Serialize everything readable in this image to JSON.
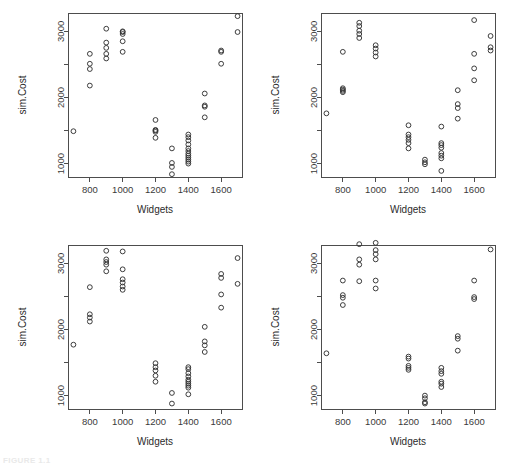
{
  "figure": {
    "caption_fragment": "FIGURE 1.1",
    "panel_count": 4,
    "layout": "2x2 grid of scatterplots"
  },
  "axes": {
    "xlabel": "Widgets",
    "ylabel": "sim.Cost",
    "x_ticks": [
      800,
      1000,
      1200,
      1400,
      1600
    ],
    "x_tick_labels": [
      "800",
      "1000",
      "1200",
      "1400",
      "1600"
    ],
    "y_ticks": [
      1000,
      2000,
      3000
    ],
    "y_tick_labels": [
      "1000",
      "2000",
      "3000"
    ],
    "y_minor_ticks": [
      1500,
      2500
    ],
    "xlim": [
      670,
      1730
    ],
    "ylim": [
      790,
      3270
    ],
    "grid": false,
    "marker": "open-circle"
  },
  "chart_data": [
    {
      "type": "scatter",
      "title": "",
      "panel": "top-left",
      "xlabel": "Widgets",
      "ylabel": "sim.Cost",
      "xlim": [
        670,
        1730
      ],
      "ylim": [
        790,
        3270
      ],
      "x_ticks": [
        800,
        1000,
        1200,
        1400,
        1600
      ],
      "y_ticks": [
        1000,
        2000,
        3000
      ],
      "grid": false,
      "legend": null,
      "series": [
        {
          "name": "sim.Cost",
          "points": [
            [
              700,
              1490
            ],
            [
              800,
              2180
            ],
            [
              800,
              2430
            ],
            [
              800,
              2510
            ],
            [
              800,
              2660
            ],
            [
              900,
              2590
            ],
            [
              900,
              2660
            ],
            [
              900,
              2750
            ],
            [
              900,
              2830
            ],
            [
              900,
              3040
            ],
            [
              1000,
              2690
            ],
            [
              1000,
              2850
            ],
            [
              1000,
              2960
            ],
            [
              1000,
              2990
            ],
            [
              1000,
              3000
            ],
            [
              1200,
              1390
            ],
            [
              1200,
              1480
            ],
            [
              1200,
              1500
            ],
            [
              1200,
              1510
            ],
            [
              1200,
              1660
            ],
            [
              1300,
              840
            ],
            [
              1300,
              950
            ],
            [
              1300,
              1010
            ],
            [
              1300,
              1230
            ],
            [
              1400,
              1000
            ],
            [
              1400,
              1030
            ],
            [
              1400,
              1060
            ],
            [
              1400,
              1090
            ],
            [
              1400,
              1120
            ],
            [
              1400,
              1150
            ],
            [
              1400,
              1190
            ],
            [
              1400,
              1230
            ],
            [
              1400,
              1290
            ],
            [
              1400,
              1350
            ],
            [
              1400,
              1400
            ],
            [
              1400,
              1440
            ],
            [
              1500,
              1700
            ],
            [
              1500,
              1860
            ],
            [
              1500,
              1880
            ],
            [
              1500,
              2060
            ],
            [
              1600,
              2510
            ],
            [
              1600,
              2690
            ],
            [
              1600,
              2710
            ],
            [
              1700,
              2990
            ],
            [
              1700,
              3230
            ]
          ]
        }
      ]
    },
    {
      "type": "scatter",
      "title": "",
      "panel": "top-right",
      "xlabel": "Widgets",
      "ylabel": "sim.Cost",
      "xlim": [
        670,
        1730
      ],
      "ylim": [
        790,
        3270
      ],
      "x_ticks": [
        800,
        1000,
        1200,
        1400,
        1600
      ],
      "y_ticks": [
        1000,
        2000,
        3000
      ],
      "grid": false,
      "legend": null,
      "series": [
        {
          "name": "sim.Cost",
          "points": [
            [
              700,
              1760
            ],
            [
              800,
              2080
            ],
            [
              800,
              2100
            ],
            [
              800,
              2120
            ],
            [
              800,
              2140
            ],
            [
              800,
              2690
            ],
            [
              900,
              2900
            ],
            [
              900,
              2960
            ],
            [
              900,
              3010
            ],
            [
              900,
              3080
            ],
            [
              900,
              3130
            ],
            [
              1000,
              2620
            ],
            [
              1000,
              2680
            ],
            [
              1000,
              2740
            ],
            [
              1000,
              2790
            ],
            [
              1200,
              1230
            ],
            [
              1200,
              1310
            ],
            [
              1200,
              1360
            ],
            [
              1200,
              1400
            ],
            [
              1200,
              1440
            ],
            [
              1200,
              1580
            ],
            [
              1300,
              990
            ],
            [
              1300,
              1020
            ],
            [
              1300,
              1060
            ],
            [
              1400,
              890
            ],
            [
              1400,
              1080
            ],
            [
              1400,
              1120
            ],
            [
              1400,
              1160
            ],
            [
              1400,
              1240
            ],
            [
              1400,
              1280
            ],
            [
              1400,
              1310
            ],
            [
              1400,
              1560
            ],
            [
              1500,
              1680
            ],
            [
              1500,
              1840
            ],
            [
              1500,
              1900
            ],
            [
              1500,
              2110
            ],
            [
              1600,
              2260
            ],
            [
              1600,
              2440
            ],
            [
              1600,
              2660
            ],
            [
              1600,
              3170
            ],
            [
              1700,
              2710
            ],
            [
              1700,
              2760
            ],
            [
              1700,
              2930
            ]
          ]
        }
      ]
    },
    {
      "type": "scatter",
      "title": "",
      "panel": "bottom-left",
      "xlabel": "Widgets",
      "ylabel": "sim.Cost",
      "xlim": [
        670,
        1730
      ],
      "ylim": [
        790,
        3270
      ],
      "x_ticks": [
        800,
        1000,
        1200,
        1400,
        1600
      ],
      "y_ticks": [
        1000,
        2000,
        3000
      ],
      "grid": false,
      "legend": null,
      "series": [
        {
          "name": "sim.Cost",
          "points": [
            [
              700,
              1770
            ],
            [
              800,
              2120
            ],
            [
              800,
              2180
            ],
            [
              800,
              2230
            ],
            [
              800,
              2640
            ],
            [
              900,
              2880
            ],
            [
              900,
              2980
            ],
            [
              900,
              3020
            ],
            [
              900,
              3060
            ],
            [
              900,
              3190
            ],
            [
              1000,
              2600
            ],
            [
              1000,
              2650
            ],
            [
              1000,
              2710
            ],
            [
              1000,
              2760
            ],
            [
              1000,
              2910
            ],
            [
              1000,
              3180
            ],
            [
              1200,
              1210
            ],
            [
              1200,
              1300
            ],
            [
              1200,
              1380
            ],
            [
              1200,
              1430
            ],
            [
              1200,
              1490
            ],
            [
              1300,
              880
            ],
            [
              1300,
              1040
            ],
            [
              1400,
              1020
            ],
            [
              1400,
              1120
            ],
            [
              1400,
              1150
            ],
            [
              1400,
              1180
            ],
            [
              1400,
              1210
            ],
            [
              1400,
              1240
            ],
            [
              1400,
              1290
            ],
            [
              1400,
              1340
            ],
            [
              1400,
              1400
            ],
            [
              1400,
              1430
            ],
            [
              1500,
              1660
            ],
            [
              1500,
              1760
            ],
            [
              1500,
              1820
            ],
            [
              1500,
              2040
            ],
            [
              1600,
              2330
            ],
            [
              1600,
              2530
            ],
            [
              1600,
              2780
            ],
            [
              1600,
              2840
            ],
            [
              1700,
              2690
            ],
            [
              1700,
              3080
            ]
          ]
        }
      ]
    },
    {
      "type": "scatter",
      "title": "",
      "panel": "bottom-right",
      "xlabel": "Widgets",
      "ylabel": "sim.Cost",
      "xlim": [
        670,
        1730
      ],
      "ylim": [
        790,
        3270
      ],
      "x_ticks": [
        800,
        1000,
        1200,
        1400,
        1600
      ],
      "y_ticks": [
        1000,
        2000,
        3000
      ],
      "grid": false,
      "legend": null,
      "series": [
        {
          "name": "sim.Cost",
          "points": [
            [
              700,
              1640
            ],
            [
              800,
              2370
            ],
            [
              800,
              2480
            ],
            [
              800,
              2520
            ],
            [
              800,
              2740
            ],
            [
              900,
              2730
            ],
            [
              900,
              2980
            ],
            [
              900,
              3060
            ],
            [
              900,
              3290
            ],
            [
              1000,
              2620
            ],
            [
              1000,
              2740
            ],
            [
              1000,
              3060
            ],
            [
              1000,
              3140
            ],
            [
              1000,
              3200
            ],
            [
              1000,
              3310
            ],
            [
              1200,
              1390
            ],
            [
              1200,
              1420
            ],
            [
              1200,
              1450
            ],
            [
              1200,
              1560
            ],
            [
              1200,
              1590
            ],
            [
              1300,
              880
            ],
            [
              1300,
              900
            ],
            [
              1300,
              960
            ],
            [
              1300,
              1000
            ],
            [
              1400,
              1130
            ],
            [
              1400,
              1180
            ],
            [
              1400,
              1210
            ],
            [
              1400,
              1330
            ],
            [
              1400,
              1370
            ],
            [
              1400,
              1420
            ],
            [
              1500,
              1680
            ],
            [
              1500,
              1860
            ],
            [
              1500,
              1900
            ],
            [
              1600,
              2460
            ],
            [
              1600,
              2490
            ],
            [
              1600,
              2740
            ],
            [
              1700,
              3210
            ]
          ]
        }
      ]
    }
  ]
}
